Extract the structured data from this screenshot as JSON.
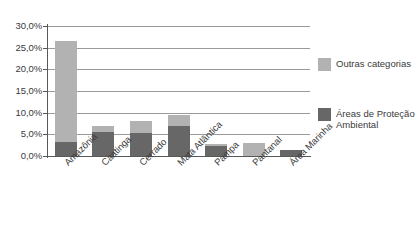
{
  "chart_data": {
    "type": "bar",
    "stacked": true,
    "title": "",
    "subtitle": "",
    "xlabel": "",
    "ylabel": "",
    "categories": [
      "Amazônia",
      "Caatinga",
      "Cerrado",
      "Mata Atlântica",
      "Pampa",
      "Pantanal",
      "Área Marinha"
    ],
    "series": [
      {
        "name": "Áreas de Proteção Ambiental",
        "color": "#676767",
        "values": [
          3.3,
          5.6,
          5.4,
          7.0,
          2.3,
          0.0,
          1.5
        ]
      },
      {
        "name": "Outras categorias",
        "color": "#b2b2b2",
        "values": [
          23.2,
          1.4,
          2.6,
          2.5,
          0.5,
          3.0,
          0.0
        ]
      }
    ],
    "totals": [
      26.5,
      7.0,
      8.0,
      9.5,
      2.8,
      3.0,
      1.5
    ],
    "ylim": [
      0,
      30
    ],
    "ytick_values": [
      0,
      5,
      10,
      15,
      20,
      25,
      30
    ],
    "ytick_labels": [
      "0,0%",
      "5,0%",
      "10,0%",
      "15,0%",
      "20,0%",
      "25,0%",
      "30,0%"
    ],
    "grid": true,
    "grid_axis": "y",
    "legend_position": "right",
    "legend": [
      {
        "label": "Outras categorias",
        "color": "#b2b2b2"
      },
      {
        "label": "Áreas de Proteção Ambiental",
        "color": "#676767"
      }
    ]
  }
}
